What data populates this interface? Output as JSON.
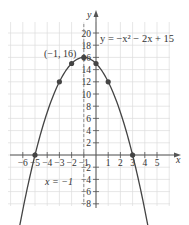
{
  "chart_data": {
    "type": "line",
    "title": "",
    "equation_label": "y = −x² − 2x + 15",
    "xlabel": "x",
    "ylabel": "y",
    "xlim": [
      -7,
      6
    ],
    "ylim": [
      -9,
      21
    ],
    "grid": true,
    "x_ticks": [
      -6,
      -5,
      -4,
      -3,
      -2,
      -1,
      1,
      2,
      3,
      4,
      5
    ],
    "x_tick_labels": [
      "−6",
      "−5",
      "−4",
      "−3",
      "−2",
      "−1",
      "1",
      "2",
      "3",
      "4",
      "5"
    ],
    "y_ticks": [
      -8,
      -6,
      -4,
      -2,
      2,
      4,
      6,
      8,
      10,
      12,
      14,
      16,
      18,
      20
    ],
    "y_tick_labels": [
      "−8",
      "−6",
      "−4",
      "−2",
      "2",
      "4",
      "6",
      "8",
      "10",
      "12",
      "14",
      "16",
      "18",
      "20"
    ],
    "series": [
      {
        "name": "y = −x² − 2x + 15",
        "function": "-x^2 - 2x + 15",
        "x_range": [
          -6.8,
          4.8
        ],
        "color": "#444444"
      }
    ],
    "points": [
      {
        "x": -5,
        "y": 0
      },
      {
        "x": -3,
        "y": 12
      },
      {
        "x": -2,
        "y": 15
      },
      {
        "x": -1,
        "y": 16
      },
      {
        "x": 0,
        "y": 15
      },
      {
        "x": 1,
        "y": 12
      },
      {
        "x": 3,
        "y": 0
      }
    ],
    "annotations": [
      {
        "text": "(−1, 16)",
        "x": -1,
        "y": 16
      },
      {
        "text": "x = −1",
        "type": "axis_of_symmetry",
        "x": -1
      }
    ]
  },
  "labels": {
    "vertex": "(−1, 16)",
    "equation": "y = −x² − 2x + 15",
    "axis_of_symmetry": "x = −1",
    "x_axis": "x",
    "y_axis": "y"
  }
}
